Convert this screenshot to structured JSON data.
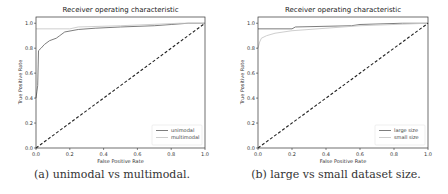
{
  "chart_data": [
    {
      "type": "line",
      "title": "Receiver operating characteristic",
      "xlabel": "False Positive Rate",
      "ylabel": "True Positive Rate",
      "xlim": [
        0.0,
        1.0
      ],
      "ylim": [
        0.0,
        1.05
      ],
      "xticks": [
        "0.0",
        "0.2",
        "0.4",
        "0.6",
        "0.8",
        "1.0"
      ],
      "yticks": [
        "0.0",
        "0.2",
        "0.4",
        "0.6",
        "0.8",
        "1.0"
      ],
      "grid": false,
      "legend_position": "lower right",
      "caption": "(a) unimodal vs multimodal.",
      "series": [
        {
          "name": "unimodal",
          "color": "#6e6e6e",
          "x": [
            0.0,
            0.005,
            0.01,
            0.015,
            0.03,
            0.05,
            0.08,
            0.12,
            0.14,
            0.17,
            0.25,
            0.35,
            0.5,
            0.7,
            0.8,
            0.9,
            1.0
          ],
          "y": [
            0.4,
            0.45,
            0.5,
            0.78,
            0.8,
            0.83,
            0.86,
            0.88,
            0.9,
            0.93,
            0.95,
            0.96,
            0.97,
            0.98,
            0.99,
            1.0,
            1.0
          ]
        },
        {
          "name": "multimodal",
          "color": "#c8c8c8",
          "x": [
            0.0,
            0.2,
            0.25,
            0.5,
            0.85,
            1.0
          ],
          "y": [
            0.955,
            0.955,
            0.97,
            0.98,
            1.0,
            1.0
          ]
        },
        {
          "name": "chance",
          "color": "#222222",
          "dashed": true,
          "x": [
            0.0,
            1.0
          ],
          "y": [
            0.0,
            1.0
          ]
        }
      ]
    },
    {
      "type": "line",
      "title": "Receiver operating characteristic",
      "xlabel": "False Positive Rate",
      "ylabel": "True Positive Rate",
      "xlim": [
        0.0,
        1.0
      ],
      "ylim": [
        0.0,
        1.05
      ],
      "xticks": [
        "0.0",
        "0.2",
        "0.4",
        "0.6",
        "0.8",
        "1.0"
      ],
      "yticks": [
        "0.0",
        "0.2",
        "0.4",
        "0.6",
        "0.8",
        "1.0"
      ],
      "grid": false,
      "legend_position": "lower right",
      "caption": "(b) large vs small dataset size.",
      "series": [
        {
          "name": "large size",
          "color": "#6e6e6e",
          "x": [
            0.0,
            0.2,
            0.22,
            0.55,
            0.6,
            0.85,
            1.0
          ],
          "y": [
            0.955,
            0.955,
            0.97,
            0.98,
            0.99,
            1.0,
            1.0
          ]
        },
        {
          "name": "small size",
          "color": "#c8c8c8",
          "x": [
            0.0,
            0.01,
            0.02,
            0.05,
            0.1,
            0.2,
            0.4,
            0.6,
            0.8,
            1.0
          ],
          "y": [
            0.8,
            0.85,
            0.88,
            0.9,
            0.92,
            0.94,
            0.96,
            0.98,
            0.99,
            1.0
          ]
        },
        {
          "name": "chance",
          "color": "#222222",
          "dashed": true,
          "x": [
            0.0,
            1.0
          ],
          "y": [
            0.0,
            1.0
          ]
        }
      ]
    }
  ]
}
